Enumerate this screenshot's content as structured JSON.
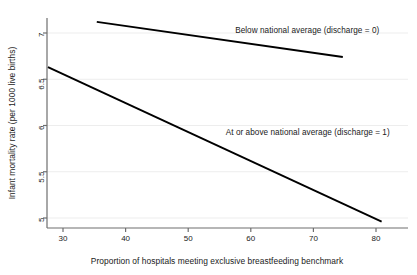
{
  "chart_data": {
    "type": "line",
    "title": "",
    "xlabel": "Proportion of hospitals meeting exclusive breastfeeding benchmark",
    "ylabel": "Infant mortality rate (per 1000 live births)",
    "xlim": [
      26.5,
      84.5
    ],
    "ylim": [
      4.85,
      7.25
    ],
    "xticks": [
      30,
      40,
      50,
      60,
      70,
      80
    ],
    "xticklabels": [
      "30",
      "40",
      "50",
      "60",
      "70",
      "80"
    ],
    "yticks": [
      5,
      5.5,
      6,
      6.5,
      7
    ],
    "yticklabels": [
      "5",
      "5.5",
      "6",
      "6.5",
      "7"
    ],
    "grid": "horizontal",
    "grid_color": "#ededed",
    "axis_color": "#6e6e6e",
    "line_color": "#000000",
    "legend_position": "inline-annotation",
    "series": [
      {
        "name": "Below national average (discharge = 0)",
        "label": "Below national average (discharge = 0)",
        "x": [
          35.4,
          74.7
        ],
        "y": [
          7.12,
          6.74
        ]
      },
      {
        "name": "At or above national average (discharge = 1)",
        "label": "At or above national average (discharge = 1)",
        "x": [
          27.6,
          80.9
        ],
        "y": [
          6.63,
          4.96
        ]
      }
    ],
    "annotations": [
      {
        "text": "Below national average (discharge = 0)",
        "x": 57.5,
        "y": 7.02
      },
      {
        "text": "At or above national average (discharge = 1)",
        "x": 56.0,
        "y": 5.92
      }
    ]
  }
}
